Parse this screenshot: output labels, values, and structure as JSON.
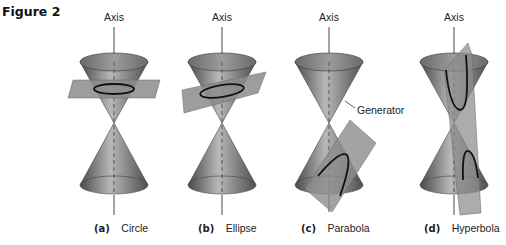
{
  "figure": {
    "title": "Figure 2",
    "panels": [
      {
        "id": "a",
        "letter": "(a)",
        "name": "Circle",
        "axis_label": "Axis"
      },
      {
        "id": "b",
        "letter": "(b)",
        "name": "Ellipse",
        "axis_label": "Axis"
      },
      {
        "id": "c",
        "letter": "(c)",
        "name": "Parabola",
        "axis_label": "Axis",
        "annotation": "Generator"
      },
      {
        "id": "d",
        "letter": "(d)",
        "name": "Hyperbola",
        "axis_label": "Axis"
      }
    ]
  },
  "colors": {
    "cone_dark": "#5f5f5f",
    "cone_light": "#b5b5b5",
    "plane": "#8c8c8c",
    "curve": "#111111",
    "axis": "#333333"
  }
}
